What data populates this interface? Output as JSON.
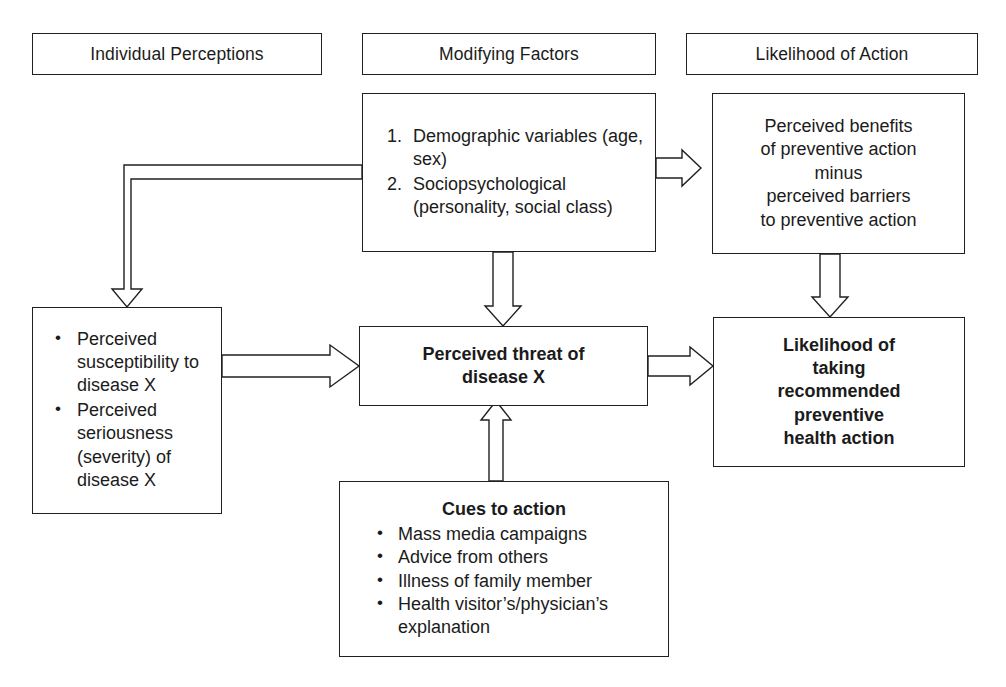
{
  "diagram": {
    "stroke_color": "#231f20",
    "background_color": "#ffffff"
  },
  "headers": [
    {
      "id": "individual-perceptions",
      "label": "Individual Perceptions"
    },
    {
      "id": "modifying-factors",
      "label": "Modifying Factors"
    },
    {
      "id": "likelihood-of-action",
      "label": "Likelihood of Action"
    }
  ],
  "nodes": {
    "modifying_factors": {
      "items": [
        "Demographic variables (age, sex)",
        "Sociopsychological (personality, social class)"
      ]
    },
    "perceived_benefits": {
      "text": "Perceived benefits\nof preventive action\nminus\nperceived barriers\nto preventive action"
    },
    "individual_perceptions": {
      "items": [
        "Perceived susceptibility to disease X",
        "Perceived seriousness (severity) of disease X"
      ]
    },
    "perceived_threat": {
      "text": "Perceived threat of\ndisease X"
    },
    "likelihood_taking": {
      "text": "Likelihood of\ntaking\nrecommended\npreventive\nhealth action"
    },
    "cues_to_action": {
      "title": "Cues to action",
      "items": [
        "Mass media campaigns",
        "Advice from others",
        "Illness of family member",
        "Health visitor’s/physician’s",
        "explanation"
      ]
    }
  },
  "connectors": [
    {
      "id": "modifying-to-individual",
      "from": "Modifying Factors",
      "to": "Individual Perceptions",
      "style": "hollow-block-elbow"
    },
    {
      "id": "modifying-to-benefits",
      "from": "Modifying Factors",
      "to": "Perceived benefits of preventive action",
      "style": "hollow-block-right"
    },
    {
      "id": "modifying-to-threat",
      "from": "Modifying Factors",
      "to": "Perceived threat of disease X",
      "style": "hollow-block-down"
    },
    {
      "id": "individual-to-threat",
      "from": "Individual Perceptions",
      "to": "Perceived threat of disease X",
      "style": "hollow-block-right"
    },
    {
      "id": "benefits-to-likelihood",
      "from": "Perceived benefits",
      "to": "Likelihood of taking recommended preventive health action",
      "style": "hollow-block-down"
    },
    {
      "id": "threat-to-likelihood",
      "from": "Perceived threat of disease X",
      "to": "Likelihood of taking recommended preventive health action",
      "style": "hollow-block-right"
    },
    {
      "id": "cues-to-threat",
      "from": "Cues to action",
      "to": "Perceived threat of disease X",
      "style": "hollow-block-up"
    }
  ]
}
